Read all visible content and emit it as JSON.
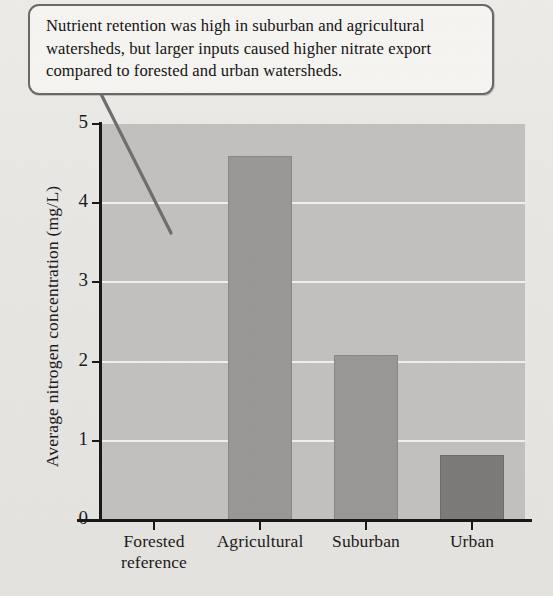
{
  "callout": {
    "text": "Nutrient retention was high in suburban and agricultural watersheds, but larger inputs caused higher nitrate export compared to forested and urban watersheds.",
    "border_color": "#6a6a6a",
    "background_color": "#f7f6f3",
    "leader_line_color": "#6f6f6f"
  },
  "chart_data": {
    "type": "bar",
    "title": "",
    "xlabel": "",
    "ylabel": "Average nitrogen concentration (mg/L)",
    "categories": [
      "Forested reference",
      "Agricultural",
      "Suburban",
      "Urban"
    ],
    "category_lines": [
      [
        "Forested",
        "reference"
      ],
      [
        "Agricultural"
      ],
      [
        "Suburban"
      ],
      [
        "Urban"
      ]
    ],
    "values": [
      0,
      4.6,
      2.08,
      0.82
    ],
    "ylim": [
      0,
      5
    ],
    "yticks": [
      0,
      1,
      2,
      3,
      4,
      5
    ],
    "ytick_labels": [
      "0",
      "1",
      "2",
      "3",
      "4",
      "5"
    ],
    "grid": true,
    "gridline_values": [
      1,
      2,
      3,
      4
    ],
    "legend": "none",
    "bar_colors": [
      "#9a9997",
      "#9a9997",
      "#9a9997",
      "#7d7c7a"
    ],
    "plot_background_color": "#c3c2c0",
    "gridline_color": "#f2f1ef",
    "axis_color": "#181818"
  },
  "page": {
    "background_color": "#eceae6"
  }
}
